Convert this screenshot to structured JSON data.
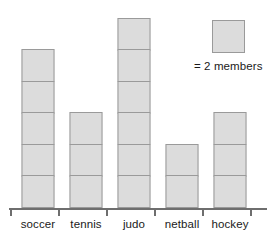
{
  "chart_data": {
    "type": "bar",
    "title": "",
    "subtitle": "",
    "xlabel": "",
    "ylabel": "",
    "grid": false,
    "legend_position": "top-right",
    "unit_value": 2,
    "unit_label": "= 2 members",
    "categories": [
      "soccer",
      "tennis",
      "judo",
      "netball",
      "hockey"
    ],
    "symbol_counts": [
      5,
      3,
      6,
      2,
      3
    ],
    "values": [
      10,
      6,
      12,
      4,
      6
    ],
    "ylim": [
      0,
      12
    ],
    "annotations": [
      "= 2 members"
    ]
  },
  "legend": {
    "key_icon": "gray-square-icon",
    "text": "= 2 members"
  },
  "axis": {
    "labels": [
      "soccer",
      "tennis",
      "judo",
      "netball",
      "hockey"
    ]
  },
  "colors": {
    "square_fill": "#dcdcdc",
    "square_border": "#9a9a9a",
    "axis": "#6e6e6e",
    "text": "#1a1a1a",
    "background": "#ffffff"
  }
}
